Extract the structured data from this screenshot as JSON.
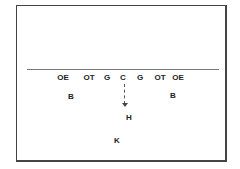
{
  "diagram": {
    "type": "football formation",
    "line_of_scrimmage": true,
    "players": [
      {
        "label": "OE",
        "x": 63,
        "y": 73
      },
      {
        "label": "OT",
        "x": 89,
        "y": 73
      },
      {
        "label": "G",
        "x": 107,
        "y": 73
      },
      {
        "label": "C",
        "x": 123,
        "y": 73
      },
      {
        "label": "G",
        "x": 140,
        "y": 73
      },
      {
        "label": "OT",
        "x": 160,
        "y": 73
      },
      {
        "label": "OE",
        "x": 178,
        "y": 73
      },
      {
        "label": "B",
        "x": 71,
        "y": 92
      },
      {
        "label": "B",
        "x": 173,
        "y": 91
      },
      {
        "label": "H",
        "x": 129,
        "y": 113
      },
      {
        "label": "K",
        "x": 117,
        "y": 136
      }
    ],
    "path": {
      "from": "C",
      "to": "H",
      "style": "dashed arrow"
    }
  }
}
